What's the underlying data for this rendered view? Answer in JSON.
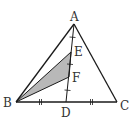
{
  "diagram": {
    "type": "geometry-triangle",
    "points": {
      "A": {
        "label": "A",
        "x": 74,
        "y": 24
      },
      "B": {
        "label": "B",
        "x": 16,
        "y": 102
      },
      "C": {
        "label": "C",
        "x": 117,
        "y": 102
      },
      "D": {
        "label": "D",
        "x": 66,
        "y": 102
      },
      "E": {
        "label": "E",
        "x": 71,
        "y": 52
      },
      "F": {
        "label": "F",
        "x": 69,
        "y": 77
      }
    },
    "segments": [
      "AB",
      "AC",
      "BC",
      "AD",
      "BE",
      "BF"
    ],
    "shaded_region": "triangle BEF",
    "equal_marks": {
      "single_tick": [
        "AE",
        "EF",
        "FD"
      ],
      "double_tick": [
        "BD",
        "DC"
      ]
    },
    "colors": {
      "line": "#1a1a1a",
      "shade": "#b8b8b8",
      "label": "#333333"
    }
  }
}
